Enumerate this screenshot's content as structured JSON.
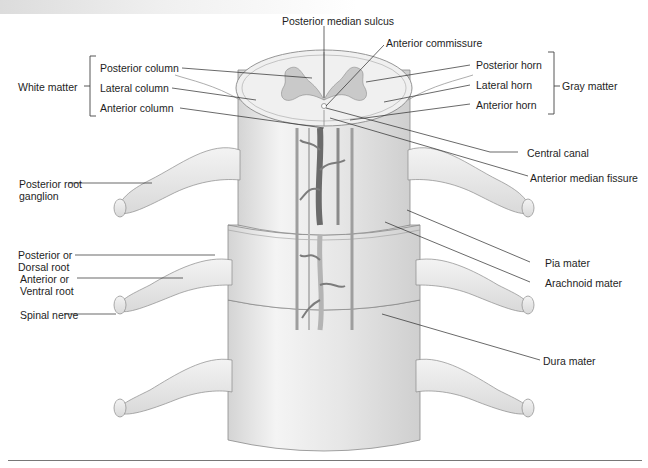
{
  "figure": {
    "labels": {
      "posterior_median_sulcus": "Posterior median sulcus",
      "anterior_commissure": "Anterior commissure",
      "posterior_horn": "Posterior horn",
      "lateral_horn": "Lateral horn",
      "anterior_horn": "Anterior horn",
      "gray_matter": "Gray matter",
      "white_matter": "White matter",
      "posterior_column": "Posterior column",
      "lateral_column": "Lateral column",
      "anterior_column": "Anterior column",
      "central_canal": "Central canal",
      "anterior_median_fissure": "Anterior median fissure",
      "posterior_root_ganglion": "Posterior root ganglion",
      "posterior_dorsal_root": "Posterior or Dorsal root",
      "anterior_ventral_root": "Anterior or Ventral root",
      "spinal_nerve": "Spinal nerve",
      "pia_mater": "Pia mater",
      "arachnoid_mater": "Arachnoid mater",
      "dura_mater": "Dura mater"
    },
    "colors": {
      "line": "#2a2a2a",
      "tissue_fill": "#ececec",
      "tissue_stroke": "#8a8a8a",
      "gray_matter_fill": "#c9c9c9",
      "vessel_dark": "#6b6b6b",
      "vessel_light": "#b4b4b4"
    }
  }
}
